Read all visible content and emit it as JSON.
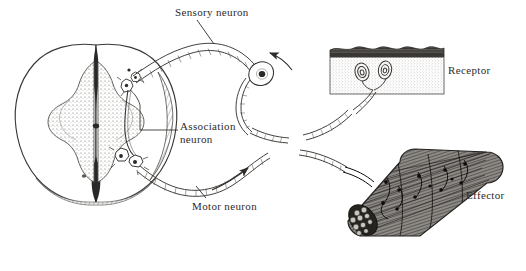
{
  "figure": {
    "background_color": "#ffffff",
    "ink_color": "#2e2b29",
    "labels": {
      "sensory_neuron": "Sensory neuron",
      "association_neuron_line1": "Association",
      "association_neuron_line2": "neuron",
      "motor_neuron": "Motor neuron",
      "receptor": "Receptor",
      "effector": "Effector"
    },
    "structures": [
      {
        "name": "spinal-cord-cross-section",
        "description": "Butterfly shaped stippled gray matter inside oval white matter"
      },
      {
        "name": "dorsal-root-ganglion",
        "description": "Sensory neuron cell body with nucleus on dorsal root"
      },
      {
        "name": "sensory-nerve-fiber",
        "description": "Myelinated axon from receptor to dorsal horn"
      },
      {
        "name": "association-neuron",
        "description": "Interneuron in gray matter connecting sensory to motor"
      },
      {
        "name": "motor-nerve-fiber",
        "description": "Myelinated axon from ventral horn to muscle"
      },
      {
        "name": "receptor-skin-block",
        "description": "Skin block with epidermis and encapsulated sensory endings"
      },
      {
        "name": "effector-muscle",
        "description": "Cylindrical skeletal muscle bundle with motor end plates"
      }
    ],
    "flow_arrows": [
      {
        "name": "sensory-direction-arrow",
        "direction": "toward spinal cord"
      },
      {
        "name": "motor-direction-arrow",
        "direction": "toward effector"
      }
    ]
  }
}
